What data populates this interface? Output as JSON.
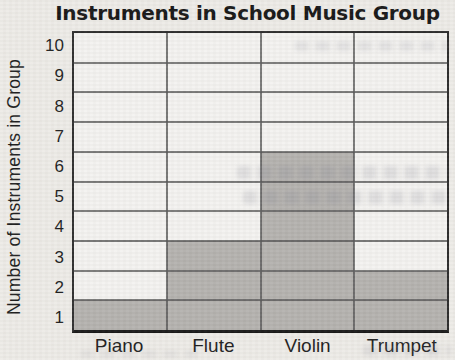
{
  "page": {
    "paper_color": "#edebe7",
    "text_color": "#1a1a1a"
  },
  "chart_data": {
    "type": "bar",
    "title": "Instruments in School Music Group",
    "ylabel": "Number of Instruments in Group",
    "xlabel": "",
    "categories": [
      "Piano",
      "Flute",
      "Violin",
      "Trumpet"
    ],
    "values": [
      1,
      3,
      6,
      2
    ],
    "ylim": [
      0,
      10
    ],
    "ytick_interval": 1,
    "ytick_labels": [
      "10",
      "9",
      "8",
      "7",
      "6",
      "5",
      "4",
      "3",
      "2",
      "1"
    ],
    "grid": true,
    "legend": false,
    "bar_color": "#b3b1ae",
    "grid_color": "#565656",
    "plot_background": "#f3f2f0",
    "border_color": "#2a2a2a",
    "axis_color": "#141414"
  }
}
